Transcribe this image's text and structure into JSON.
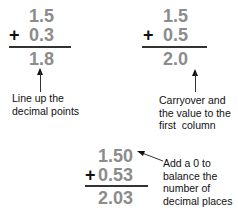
{
  "examples": [
    {
      "top": "1.5",
      "operator": "+",
      "bottom": "0.3",
      "result": "1.8",
      "note": "Line up the\ndecimal points"
    },
    {
      "top": "1.5",
      "operator": "+",
      "bottom": "0.5",
      "result": "2.0",
      "note": "Carryover and\nthe value to the\nfirst  column"
    },
    {
      "top": "1.50",
      "operator": "+",
      "bottom": "0.53",
      "result": "2.03",
      "note": "Add a 0 to\nbalance the\nnumber of\ndecimal places"
    }
  ],
  "colors": {
    "digits": "#8c8c8c",
    "text": "#111111",
    "rule": "#333333"
  }
}
